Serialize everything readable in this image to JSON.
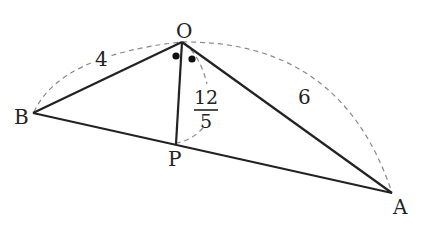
{
  "diagram": {
    "type": "geometry-triangle",
    "points": {
      "O": {
        "label": "O",
        "x": 182,
        "y": 42
      },
      "B": {
        "label": "B",
        "x": 33,
        "y": 113
      },
      "A": {
        "label": "A",
        "x": 392,
        "y": 193
      },
      "P": {
        "label": "P",
        "x": 176,
        "y": 144
      }
    },
    "segments": [
      {
        "from": "O",
        "to": "B",
        "style": "solid"
      },
      {
        "from": "O",
        "to": "A",
        "style": "solid"
      },
      {
        "from": "B",
        "to": "A",
        "style": "solid"
      },
      {
        "from": "O",
        "to": "P",
        "style": "solid"
      }
    ],
    "lengths": {
      "OB": "4",
      "OA": "6",
      "OP": {
        "numerator": "12",
        "denominator": "5"
      }
    },
    "angle_marks": {
      "description": "equal angles BOP and POA (OP bisects angle BOA)",
      "symbol": "dot"
    },
    "colors": {
      "line": "#222222",
      "dashed": "#888888",
      "background": "#ffffff"
    }
  }
}
